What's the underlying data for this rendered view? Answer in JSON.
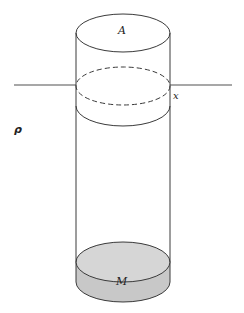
{
  "diagram": {
    "type": "physics-figure",
    "labels": {
      "area": "A",
      "displacement": "x",
      "density": "ρ",
      "mass": "M"
    },
    "colors": {
      "stroke": "#3a3a3a",
      "surface_line": "#8a8a8a",
      "mass_fill": "#c8c8c8",
      "mass_top_fill": "#d6d6d6",
      "background": "#ffffff"
    }
  }
}
